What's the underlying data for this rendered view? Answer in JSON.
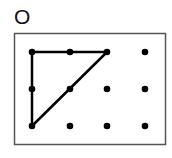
{
  "figure": {
    "label": "O",
    "grid": {
      "columns": [
        32,
        70,
        107,
        145
      ],
      "rows": [
        52,
        89,
        126
      ]
    },
    "frame": {
      "x": 14,
      "y": 33,
      "width": 151,
      "height": 111
    },
    "shape": {
      "type": "right-triangle",
      "vertices": [
        [
          0,
          0
        ],
        [
          2,
          0
        ],
        [
          0,
          2
        ]
      ],
      "description": "Triangle connecting top-left, top third-column, and bottom-left grid points"
    },
    "colors": {
      "stroke": "#000000",
      "dot": "#000000",
      "frame": "#555555"
    }
  }
}
